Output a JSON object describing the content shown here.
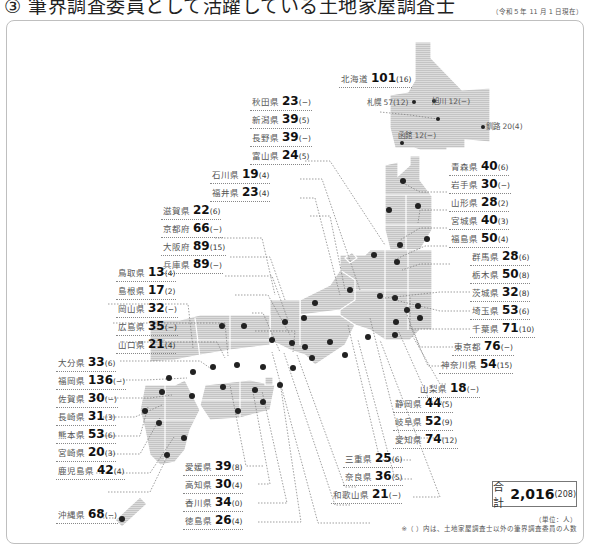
{
  "header": {
    "title": "③ 筆界調査委員として活躍している土地家屋調査士",
    "as_of": "（令和５年 11 月 1 日現在）"
  },
  "map": {
    "fill_color": "#d4d4d4",
    "dot_color": "#222222",
    "prefectures": [
      {
        "name": "北海道",
        "value": "101",
        "paren": "(16)"
      },
      {
        "name": "秋田県",
        "value": "23",
        "paren": "(−)"
      },
      {
        "name": "新潟県",
        "value": "39",
        "paren": "(5)"
      },
      {
        "name": "長野県",
        "value": "39",
        "paren": "(−)"
      },
      {
        "name": "富山県",
        "value": "24",
        "paren": "(5)"
      },
      {
        "name": "石川県",
        "value": "19",
        "paren": "(4)"
      },
      {
        "name": "福井県",
        "value": "23",
        "paren": "(4)"
      },
      {
        "name": "滋賀県",
        "value": "22",
        "paren": "(6)"
      },
      {
        "name": "京都府",
        "value": "66",
        "paren": "(−)"
      },
      {
        "name": "大阪府",
        "value": "89",
        "paren": "(15)"
      },
      {
        "name": "兵庫県",
        "value": "89",
        "paren": "(−)"
      },
      {
        "name": "鳥取県",
        "value": "13",
        "paren": "(4)"
      },
      {
        "name": "島根県",
        "value": "17",
        "paren": "(2)"
      },
      {
        "name": "岡山県",
        "value": "32",
        "paren": "(−)"
      },
      {
        "name": "広島県",
        "value": "35",
        "paren": "(−)"
      },
      {
        "name": "山口県",
        "value": "21",
        "paren": "(4)"
      },
      {
        "name": "大分県",
        "value": "33",
        "paren": "(6)"
      },
      {
        "name": "福岡県",
        "value": "136",
        "paren": "(−)"
      },
      {
        "name": "佐賀県",
        "value": "30",
        "paren": "(−)"
      },
      {
        "name": "長崎県",
        "value": "31",
        "paren": "(3)"
      },
      {
        "name": "熊本県",
        "value": "53",
        "paren": "(6)"
      },
      {
        "name": "宮崎県",
        "value": "20",
        "paren": "(3)"
      },
      {
        "name": "鹿児島県",
        "value": "42",
        "paren": "(4)"
      },
      {
        "name": "沖縄県",
        "value": "68",
        "paren": "(−)"
      },
      {
        "name": "愛媛県",
        "value": "39",
        "paren": "(8)"
      },
      {
        "name": "高知県",
        "value": "30",
        "paren": "(4)"
      },
      {
        "name": "香川県",
        "value": "34",
        "paren": "(0)"
      },
      {
        "name": "徳島県",
        "value": "26",
        "paren": "(4)"
      },
      {
        "name": "三重県",
        "value": "25",
        "paren": "(6)"
      },
      {
        "name": "奈良県",
        "value": "36",
        "paren": "(5)"
      },
      {
        "name": "和歌山県",
        "value": "21",
        "paren": "(−)"
      },
      {
        "name": "静岡県",
        "value": "44",
        "paren": "(5)"
      },
      {
        "name": "岐阜県",
        "value": "52",
        "paren": "(9)"
      },
      {
        "name": "愛知県",
        "value": "74",
        "paren": "(12)"
      },
      {
        "name": "山梨県",
        "value": "18",
        "paren": "(−)"
      },
      {
        "name": "神奈川県",
        "value": "54",
        "paren": "(15)"
      },
      {
        "name": "東京都",
        "value": "76",
        "paren": "(−)"
      },
      {
        "name": "千葉県",
        "value": "71",
        "paren": "(10)"
      },
      {
        "name": "埼玉県",
        "value": "53",
        "paren": "(6)"
      },
      {
        "name": "茨城県",
        "value": "32",
        "paren": "(8)"
      },
      {
        "name": "栃木県",
        "value": "50",
        "paren": "(8)"
      },
      {
        "name": "群馬県",
        "value": "28",
        "paren": "(6)"
      },
      {
        "name": "福島県",
        "value": "50",
        "paren": "(4)"
      },
      {
        "name": "宮城県",
        "value": "40",
        "paren": "(3)"
      },
      {
        "name": "山形県",
        "value": "28",
        "paren": "(2)"
      },
      {
        "name": "岩手県",
        "value": "30",
        "paren": "(−)"
      },
      {
        "name": "青森県",
        "value": "40",
        "paren": "(6)"
      }
    ],
    "hokkaido_cities": [
      {
        "name": "旭川",
        "value": "12(−)"
      },
      {
        "name": "札幌",
        "value": "57(12)"
      },
      {
        "name": "釧路",
        "value": "20(4)"
      },
      {
        "name": "函館",
        "value": "12(−)"
      }
    ]
  },
  "summary": {
    "total_label": "合計",
    "total_value": "2,016",
    "total_paren": "(208)",
    "unit": "（単位：人）",
    "note": "※（ ）内は、土地家屋調査士以外の筆界調査委員の人数"
  }
}
